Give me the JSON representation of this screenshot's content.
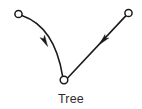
{
  "figure": {
    "caption": "Tree",
    "background_color": "#ffffff",
    "ink_color": "#1a1a1a",
    "caption_color": "#2b2b2b",
    "node_fill_color": "#ffffff",
    "width": 142,
    "height": 109,
    "nodes": [
      {
        "id": "left-leaf",
        "label": "",
        "cx": 18.5,
        "cy": 14.0,
        "r": 3.6
      },
      {
        "id": "right-leaf",
        "label": "",
        "cx": 128.5,
        "cy": 13.0,
        "r": 3.6
      },
      {
        "id": "root",
        "label": "",
        "cx": 64.0,
        "cy": 80.0,
        "r": 3.8
      }
    ],
    "edges": [
      {
        "id": "left-edge",
        "from": "left-leaf",
        "to": "root",
        "style": "curved",
        "directed": true,
        "path": "M 21.8 15.6 C 42.0 22.5 57.0 42.0 62.6 76.2",
        "arrow_at": {
          "x": 45.0,
          "y": 41.5,
          "angle_deg": 62
        }
      },
      {
        "id": "right-edge",
        "from": "right-leaf",
        "to": "root",
        "style": "straight",
        "directed": true,
        "path": "M 126.0 15.6 L 67.6 78.0",
        "arrow_at": {
          "x": 103.0,
          "y": 40.5,
          "angle_deg": 133
        }
      }
    ],
    "arrow": {
      "length": 11.5,
      "half_width": 2.6,
      "notch": 2.6
    }
  }
}
